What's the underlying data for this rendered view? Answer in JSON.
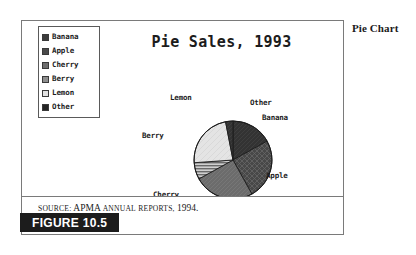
{
  "margin_note": "Pie Chart",
  "figure": {
    "tag_label": "FIGURE 10.5",
    "source_prefix": "S",
    "source_text": "OURCE: APMA A",
    "source_full": "SOURCE: APMA ANNUAL REPORTS, 1994."
  },
  "source": {
    "word_source": "SOURCE:",
    "word_apma": "APMA",
    "word_annual": "ANNUAL",
    "word_reports": "REPORTS,",
    "word_year": "1994."
  },
  "legend": {
    "items": [
      {
        "label": "Banana",
        "color": "#3c3c3c"
      },
      {
        "label": "Apple",
        "color": "#4a4a4a"
      },
      {
        "label": "Cherry",
        "color": "#6e6e6e"
      },
      {
        "label": "Berry",
        "color": "#8e8e8e"
      },
      {
        "label": "Lemon",
        "color": "#e2e2e2"
      },
      {
        "label": "Other",
        "color": "#242424"
      }
    ]
  },
  "chart_data": {
    "type": "pie",
    "title": "Pie Sales, 1993",
    "xlabel": "",
    "ylabel": "",
    "legend_position": "top-left",
    "grid": false,
    "categories": [
      "Banana",
      "Apple",
      "Cherry",
      "Berry",
      "Lemon",
      "Other"
    ],
    "values": [
      17,
      25,
      25,
      7,
      23,
      3
    ],
    "units": "percent",
    "slices": [
      {
        "label": "Banana",
        "value": 17,
        "start_angle": 0,
        "end_angle": 61,
        "color": "#3c3c3c",
        "pattern": "solid-dark"
      },
      {
        "label": "Apple",
        "value": 25,
        "start_angle": 61,
        "end_angle": 151,
        "color": "#4a4a4a",
        "pattern": "crosshatch"
      },
      {
        "label": "Cherry",
        "value": 25,
        "start_angle": 151,
        "end_angle": 241,
        "color": "#6e6e6e",
        "pattern": "solid-medium"
      },
      {
        "label": "Berry",
        "value": 7,
        "start_angle": 241,
        "end_angle": 266,
        "color": "#8e8e8e",
        "pattern": "horizontal-stripes"
      },
      {
        "label": "Lemon",
        "value": 23,
        "start_angle": 266,
        "end_angle": 349,
        "color": "#e2e2e2",
        "pattern": "solid-light"
      },
      {
        "label": "Other",
        "value": 3,
        "start_angle": 349,
        "end_angle": 360,
        "color": "#242424",
        "pattern": "solid-dark"
      }
    ],
    "callout_labels": [
      {
        "text": "Lemon",
        "x": 148,
        "y": 78
      },
      {
        "text": "Other",
        "x": 228,
        "y": 83
      },
      {
        "text": "Banana",
        "x": 240,
        "y": 98
      },
      {
        "text": "Berry",
        "x": 123,
        "y": 116
      },
      {
        "text": "Apple",
        "x": 245,
        "y": 155
      },
      {
        "text": "Cherry",
        "x": 134,
        "y": 175
      }
    ]
  }
}
